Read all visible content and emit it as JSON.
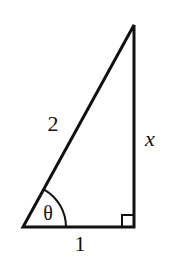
{
  "diagram": {
    "type": "right-triangle",
    "labels": {
      "hypotenuse": "2",
      "vertical_side": "x",
      "base": "1",
      "angle": "θ"
    },
    "right_angle_marker": true,
    "stroke_color": "#111111",
    "background": "#ffffff"
  }
}
